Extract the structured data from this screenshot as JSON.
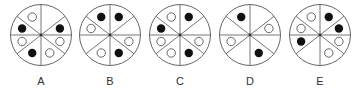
{
  "figure": {
    "sector_order": [
      "top-right-upper",
      "right-upper",
      "right-lower",
      "bottom-right",
      "bottom-left",
      "left-lower",
      "left-upper",
      "top-left-upper"
    ],
    "colors": {
      "stroke": "#666666",
      "filled_dot": "#111111",
      "open_dot_stroke": "#555555",
      "label": "#333333"
    },
    "options": [
      {
        "label": "A",
        "sectors": [
          "empty",
          "filled",
          "open",
          "open",
          "filled",
          "open",
          "filled",
          "open"
        ]
      },
      {
        "label": "B",
        "sectors": [
          "filled",
          "empty",
          "open",
          "filled",
          "open",
          "empty",
          "open",
          "filled"
        ]
      },
      {
        "label": "C",
        "sectors": [
          "filled",
          "empty",
          "open",
          "filled",
          "open",
          "open",
          "filled",
          "open"
        ]
      },
      {
        "label": "D",
        "sectors": [
          "empty",
          "open",
          "empty",
          "filled",
          "empty",
          "open",
          "empty",
          "filled"
        ]
      },
      {
        "label": "E",
        "sectors": [
          "filled",
          "filled",
          "open",
          "open",
          "empty",
          "filled",
          "open",
          "open"
        ]
      }
    ]
  }
}
